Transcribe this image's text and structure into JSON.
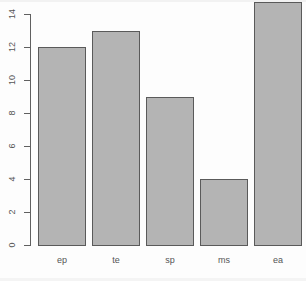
{
  "chart_data": {
    "type": "bar",
    "title": "",
    "subtitle": "",
    "xlabel": "",
    "ylabel": "",
    "categories": [
      "ep",
      "te",
      "sp",
      "ms",
      "ea"
    ],
    "values": [
      12,
      13,
      9,
      4,
      15
    ],
    "series": [
      {
        "name": "count",
        "values": [
          12,
          13,
          9,
          4,
          15
        ]
      }
    ],
    "ylim": [
      0,
      14
    ],
    "y_ticks": [
      0,
      2,
      4,
      6,
      8,
      10,
      12,
      14
    ],
    "y_tick_labels": [
      "0",
      "2",
      "4",
      "6",
      "8",
      "10",
      "12",
      "14"
    ],
    "grid": false,
    "legend": false,
    "legend_position": "none",
    "style": {
      "bar_fill": "#b4b4b4",
      "bar_border": "#5a5a5a",
      "axis_color": "#606060",
      "tick_label_color": "#555555",
      "background": "#fdfdfd",
      "y_tick_label_rotation": -90
    }
  }
}
